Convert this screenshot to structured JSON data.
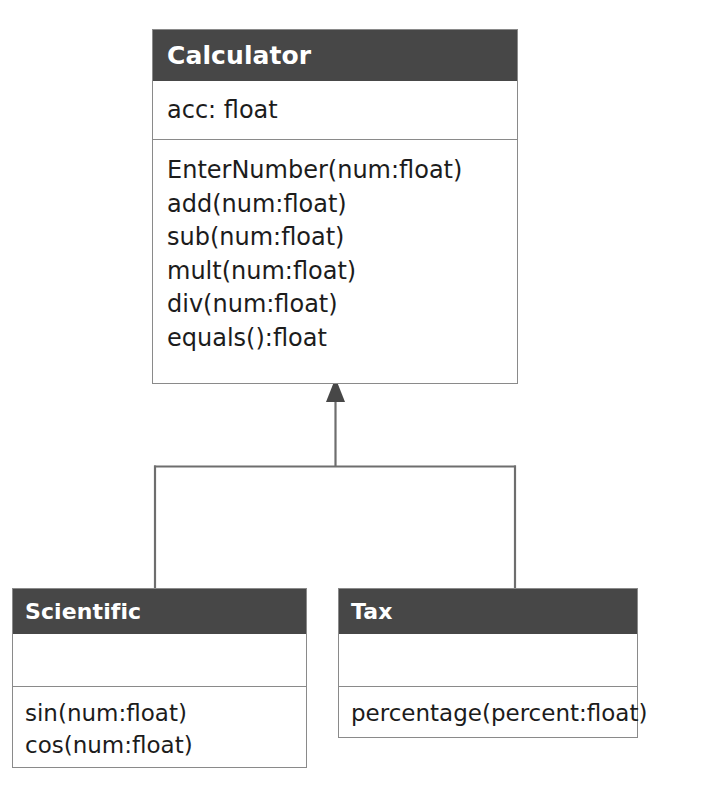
{
  "diagram": {
    "type": "uml-class-diagram",
    "relationship": "generalization",
    "colors": {
      "header_background": "#474747",
      "header_text": "#ffffff",
      "box_background": "#ffffff",
      "border": "#8a8a8a",
      "connector": "#6e6e6e",
      "arrowhead": "#474747",
      "member_text": "#1c1c1c"
    },
    "classes": {
      "calculator": {
        "name": "Calculator",
        "attributes": [
          "acc: float"
        ],
        "methods": [
          "EnterNumber(num:float)",
          "add(num:float)",
          "sub(num:float)",
          "mult(num:float)",
          "div(num:float)",
          "equals():float"
        ]
      },
      "scientific": {
        "name": "Scientific",
        "attributes": [],
        "methods": [
          "sin(num:float)",
          "cos(num:float)"
        ]
      },
      "tax": {
        "name": "Tax",
        "attributes": [],
        "methods": [
          "percentage(percent:float)"
        ]
      }
    },
    "generalizations": [
      {
        "child": "Scientific",
        "parent": "Calculator"
      },
      {
        "child": "Tax",
        "parent": "Calculator"
      }
    ]
  }
}
